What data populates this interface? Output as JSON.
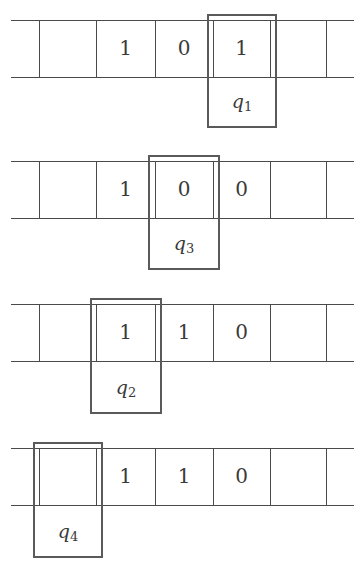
{
  "diagram": {
    "type": "turing-machine-tape-sequence",
    "line_color": "#4a4a4a",
    "head_color": "#5a5a5a",
    "configurations": [
      {
        "cells": [
          "",
          "1",
          "0",
          "1",
          ""
        ],
        "head_position": 3,
        "state_symbol": "q",
        "state_index": "1"
      },
      {
        "cells": [
          "",
          "1",
          "0",
          "0",
          ""
        ],
        "head_position": 2,
        "state_symbol": "q",
        "state_index": "3"
      },
      {
        "cells": [
          "",
          "1",
          "1",
          "0",
          ""
        ],
        "head_position": 1,
        "state_symbol": "q",
        "state_index": "2"
      },
      {
        "cells": [
          "",
          "1",
          "1",
          "0",
          ""
        ],
        "head_position": 0,
        "state_symbol": "q",
        "state_index": "4"
      }
    ]
  }
}
